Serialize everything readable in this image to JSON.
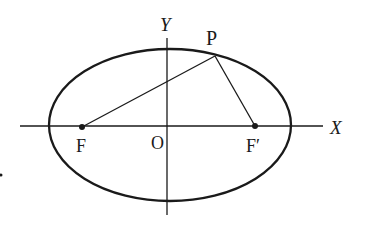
{
  "diagram": {
    "type": "ellipse-foci",
    "labels": {
      "x_axis": "X",
      "y_axis": "Y",
      "origin": "O",
      "point": "P",
      "focus_left": "F",
      "focus_right": "F′"
    },
    "colors": {
      "stroke": "#1a1a1a",
      "background": "#ffffff"
    }
  }
}
